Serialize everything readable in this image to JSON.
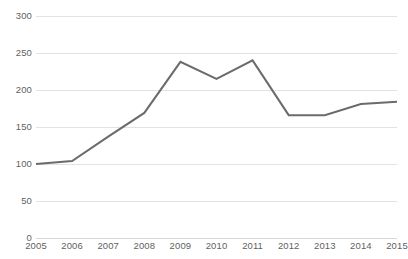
{
  "chart_data": {
    "type": "line",
    "title": "",
    "xlabel": "",
    "ylabel": "",
    "categories": [
      "2005",
      "2006",
      "2007",
      "2008",
      "2009",
      "2010",
      "2011",
      "2012",
      "2013",
      "2014",
      "2015"
    ],
    "values": [
      100,
      104,
      137,
      169,
      238,
      215,
      240,
      166,
      166,
      181,
      184
    ],
    "series": [
      {
        "name": "Index",
        "values": [
          100,
          104,
          137,
          169,
          238,
          215,
          240,
          166,
          166,
          181,
          184
        ],
        "color": "#6b6b6b"
      }
    ],
    "ylim": [
      0,
      300
    ],
    "y_ticks": [
      0,
      50,
      100,
      150,
      200,
      250,
      300
    ],
    "y_tick_labels": [
      "0",
      "50",
      "100",
      "150",
      "200",
      "250",
      "300"
    ],
    "grid": true,
    "legend": false,
    "legend_position": "none",
    "line_color": "#6b6b6b",
    "gridline_color": "#e2e2e2",
    "axis_text_color": "#5f5f5f",
    "background_color": "#ffffff",
    "markers": false,
    "line_width": 2
  }
}
